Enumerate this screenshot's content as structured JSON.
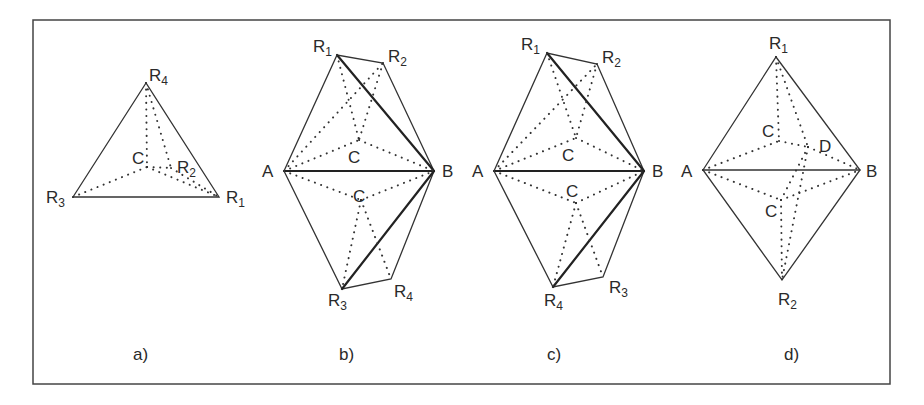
{
  "figure": {
    "panels": [
      {
        "caption": "a)",
        "vertices": {
          "R4": [
            146,
            83
          ],
          "R3": [
            73,
            197
          ],
          "R1": [
            219,
            197
          ],
          "C": [
            147,
            167
          ],
          "R2": [
            171,
            168
          ]
        },
        "labels": [
          {
            "id": "R4",
            "base": "R",
            "sub": "4"
          },
          {
            "id": "C",
            "base": "C",
            "sub": ""
          },
          {
            "id": "R2",
            "base": "R",
            "sub": "2"
          },
          {
            "id": "R3",
            "base": "R",
            "sub": "3"
          },
          {
            "id": "R1",
            "base": "R",
            "sub": "1"
          }
        ]
      },
      {
        "caption": "b)",
        "vertices": {
          "A": [
            284,
            171
          ],
          "B": [
            434,
            171
          ],
          "R1": [
            337,
            55
          ],
          "R2": [
            383,
            63
          ],
          "C_upper": [
            359,
            140
          ],
          "C_lower": [
            361,
            200
          ],
          "R3": [
            342,
            289
          ],
          "R4": [
            391,
            279
          ]
        },
        "labels": [
          {
            "id": "R1",
            "base": "R",
            "sub": "1"
          },
          {
            "id": "R2",
            "base": "R",
            "sub": "2"
          },
          {
            "id": "A",
            "base": "A",
            "sub": ""
          },
          {
            "id": "B",
            "base": "B",
            "sub": ""
          },
          {
            "id": "C_upper",
            "base": "C",
            "sub": ""
          },
          {
            "id": "C_lower",
            "base": "C",
            "sub": ""
          },
          {
            "id": "R3",
            "base": "R",
            "sub": "3"
          },
          {
            "id": "R4",
            "base": "R",
            "sub": "4"
          }
        ]
      },
      {
        "caption": "c)",
        "vertices": {
          "A": [
            494,
            171
          ],
          "B": [
            644,
            171
          ],
          "R1": [
            547,
            53
          ],
          "R2": [
            597,
            64
          ],
          "C_upper": [
            574,
            138
          ],
          "C_lower": [
            574,
            202
          ],
          "R4": [
            553,
            287
          ],
          "R3": [
            603,
            277
          ]
        },
        "labels": [
          {
            "id": "R1",
            "base": "R",
            "sub": "1"
          },
          {
            "id": "R2",
            "base": "R",
            "sub": "2"
          },
          {
            "id": "A",
            "base": "A",
            "sub": ""
          },
          {
            "id": "B",
            "base": "B",
            "sub": ""
          },
          {
            "id": "C_upper",
            "base": "C",
            "sub": ""
          },
          {
            "id": "C_lower",
            "base": "C",
            "sub": ""
          },
          {
            "id": "R4",
            "base": "R",
            "sub": "4"
          },
          {
            "id": "R3",
            "base": "R",
            "sub": "3"
          }
        ]
      },
      {
        "caption": "d)",
        "vertices": {
          "A": [
            703,
            170
          ],
          "B": [
            860,
            170
          ],
          "R1": [
            776,
            57
          ],
          "R2": [
            782,
            280
          ],
          "C_upper": [
            779,
            141
          ],
          "D": [
            808,
            147
          ],
          "C_lower": [
            781,
            200
          ]
        },
        "labels": [
          {
            "id": "R1",
            "base": "R",
            "sub": "1"
          },
          {
            "id": "C_upper",
            "base": "C",
            "sub": ""
          },
          {
            "id": "D",
            "base": "D",
            "sub": ""
          },
          {
            "id": "A",
            "base": "A",
            "sub": ""
          },
          {
            "id": "B",
            "base": "B",
            "sub": ""
          },
          {
            "id": "C_lower",
            "base": "C",
            "sub": ""
          },
          {
            "id": "R2",
            "base": "R",
            "sub": "2"
          }
        ]
      }
    ]
  }
}
